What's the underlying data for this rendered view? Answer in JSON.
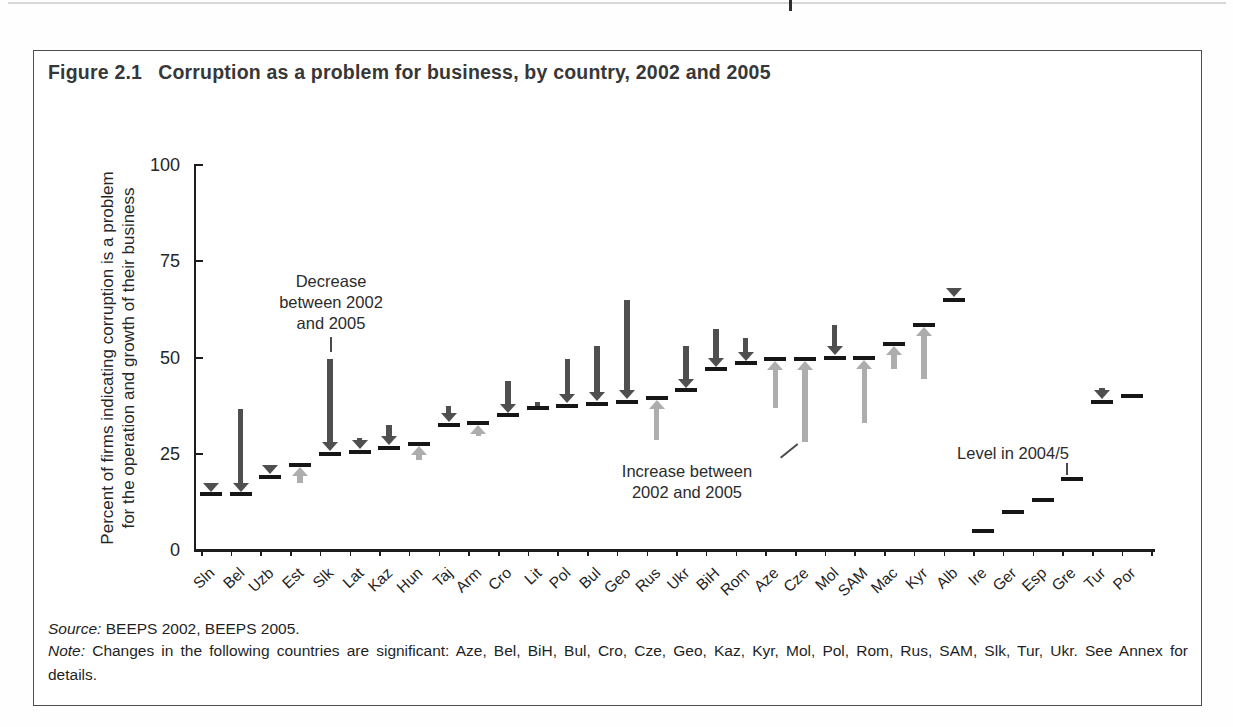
{
  "artifacts": {
    "cut_off_text_fragment": "p"
  },
  "figure": {
    "label": "Figure 2.1",
    "title": "Corruption as a problem for business, by country, 2002 and 2005"
  },
  "chart_data": {
    "type": "scatter",
    "subtype": "paired-change-arrows-with-level-dashes",
    "ylabel_lines": [
      "Percent of firms indicating corruption is a problem",
      "for the operation and growth of their business"
    ],
    "ylim": [
      0,
      100
    ],
    "yticks": [
      0,
      25,
      50,
      75,
      100
    ],
    "grid": false,
    "categories": [
      "Sln",
      "Bel",
      "Uzb",
      "Est",
      "Slk",
      "Lat",
      "Kaz",
      "Hun",
      "Taj",
      "Arm",
      "Cro",
      "Lit",
      "Pol",
      "Bul",
      "Geo",
      "Rus",
      "Ukr",
      "BiH",
      "Rom",
      "Aze",
      "Cze",
      "Mol",
      "SAM",
      "Mac",
      "Kyr",
      "Alb",
      "Ire",
      "Ger",
      "Esp",
      "Gre",
      "Tur",
      "Por"
    ],
    "series": [
      {
        "name": "2002",
        "values": [
          17.5,
          36.5,
          22,
          17.5,
          49.5,
          29,
          32.5,
          23.5,
          37.5,
          29.5,
          44,
          38.5,
          49.5,
          53,
          65,
          28.5,
          53,
          57.5,
          55,
          37,
          28,
          58.5,
          33,
          47,
          44.5,
          68,
          null,
          null,
          null,
          null,
          42,
          null
        ]
      },
      {
        "name": "2005",
        "values": [
          14.5,
          14.5,
          19,
          22,
          25,
          25.5,
          26.5,
          27.5,
          32.5,
          33,
          35,
          37,
          37.5,
          38,
          38.5,
          39.5,
          41.5,
          47,
          48.5,
          49.5,
          49.5,
          50,
          50,
          53.5,
          58.5,
          65,
          null,
          null,
          null,
          null,
          38.5,
          null
        ]
      },
      {
        "name": "Level in 2004/5",
        "values": [
          null,
          null,
          null,
          null,
          null,
          null,
          null,
          null,
          null,
          null,
          null,
          null,
          null,
          null,
          null,
          null,
          null,
          null,
          null,
          null,
          null,
          null,
          null,
          null,
          null,
          null,
          5,
          10,
          13,
          18.5,
          null,
          40
        ]
      }
    ],
    "colors": {
      "decrease": "#4f4f4f",
      "increase": "#adadad",
      "dash": "#161616"
    },
    "annotations": {
      "decrease": {
        "lines": [
          "Decrease",
          "between 2002",
          "and 2005"
        ]
      },
      "increase": {
        "lines": [
          "Increase between",
          "2002 and 2005"
        ]
      },
      "level": {
        "text": "Level in 2004/5"
      }
    },
    "legend_position": "none"
  },
  "footer": {
    "source_label": "Source:",
    "source_text": "BEEPS 2002, BEEPS 2005.",
    "note_label": "Note:",
    "note_line1": "Changes in the following countries are significant: Aze, Bel, BiH, Bul, Cro, Cze, Geo, Kaz, Kyr, Mol, Pol, Rom, Rus, SAM, Slk, Tur, Ukr. See Annex for",
    "note_line2": "details."
  }
}
